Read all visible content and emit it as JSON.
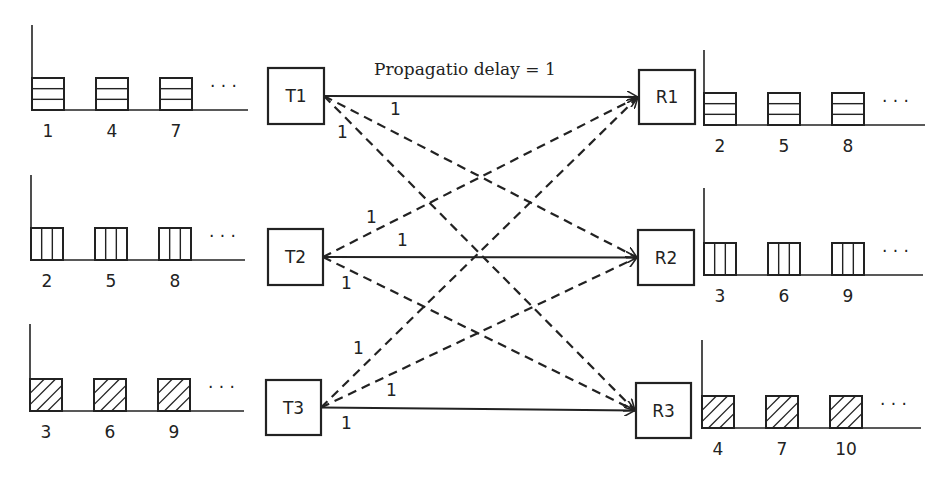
{
  "title": "Propagatio delay = 1",
  "transmitters": [
    {
      "id": "T1",
      "x": 268,
      "y": 68,
      "w": 56,
      "h": 56
    },
    {
      "id": "T2",
      "x": 268,
      "y": 229,
      "w": 55,
      "h": 56
    },
    {
      "id": "T3",
      "x": 266,
      "y": 380,
      "w": 55,
      "h": 55
    }
  ],
  "receivers": [
    {
      "id": "R1",
      "x": 639,
      "y": 70,
      "w": 56,
      "h": 54
    },
    {
      "id": "R2",
      "x": 638,
      "y": 230,
      "w": 56,
      "h": 55
    },
    {
      "id": "R3",
      "x": 636,
      "y": 383,
      "w": 55,
      "h": 55
    }
  ],
  "tx_queues": [
    {
      "pattern": "horizontal",
      "packets": [
        "1",
        "4",
        "7"
      ],
      "axis_x": 32,
      "top_y": 25,
      "base_y": 110,
      "end_x": 248
    },
    {
      "pattern": "vertical",
      "packets": [
        "2",
        "5",
        "8"
      ],
      "axis_x": 31,
      "top_y": 175,
      "base_y": 260,
      "end_x": 245
    },
    {
      "pattern": "diagonal",
      "packets": [
        "3",
        "6",
        "9"
      ],
      "axis_x": 30,
      "top_y": 324,
      "base_y": 411,
      "end_x": 244
    }
  ],
  "rx_queues": [
    {
      "pattern": "horizontal",
      "packets": [
        "2",
        "5",
        "8"
      ],
      "axis_x": 704,
      "top_y": 50,
      "base_y": 125,
      "end_x": 925
    },
    {
      "pattern": "vertical",
      "packets": [
        "3",
        "6",
        "9"
      ],
      "axis_x": 704,
      "top_y": 188,
      "base_y": 275,
      "end_x": 923
    },
    {
      "pattern": "diagonal",
      "packets": [
        "4",
        "7",
        "10"
      ],
      "axis_x": 702,
      "top_y": 340,
      "base_y": 428,
      "end_x": 921
    }
  ],
  "ellipsis": "· · ·",
  "delay_label": "1",
  "links": [
    {
      "from": 0,
      "to": 0,
      "style": "solid"
    },
    {
      "from": 0,
      "to": 1,
      "style": "dashed"
    },
    {
      "from": 0,
      "to": 2,
      "style": "dashed"
    },
    {
      "from": 1,
      "to": 0,
      "style": "dashed"
    },
    {
      "from": 1,
      "to": 1,
      "style": "solid"
    },
    {
      "from": 1,
      "to": 2,
      "style": "dashed"
    },
    {
      "from": 2,
      "to": 0,
      "style": "dashed"
    },
    {
      "from": 2,
      "to": 1,
      "style": "dashed"
    },
    {
      "from": 2,
      "to": 2,
      "style": "solid"
    }
  ],
  "link_labels": [
    {
      "text": "1",
      "x": 390,
      "y": 115
    },
    {
      "text": "1",
      "x": 337,
      "y": 138
    },
    {
      "text": "1",
      "x": 366,
      "y": 223
    },
    {
      "text": "1",
      "x": 397,
      "y": 246
    },
    {
      "text": "1",
      "x": 341,
      "y": 289
    },
    {
      "text": "1",
      "x": 353,
      "y": 354
    },
    {
      "text": "1",
      "x": 386,
      "y": 396
    },
    {
      "text": "1",
      "x": 341,
      "y": 429
    }
  ]
}
